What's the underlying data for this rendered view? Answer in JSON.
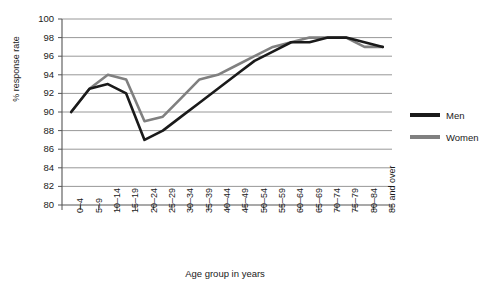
{
  "chart_data": {
    "type": "line",
    "title": "",
    "xlabel": "Age group in years",
    "ylabel": "% response rate",
    "ylim": [
      80,
      100
    ],
    "ytick_step": 2,
    "yticks": [
      "100",
      "98",
      "96",
      "94",
      "92",
      "90",
      "88",
      "86",
      "84",
      "82",
      "80"
    ],
    "grid": true,
    "legend_position": "right",
    "categories": [
      "0–4",
      "5–9",
      "10–14",
      "15–19",
      "20–24",
      "25–29",
      "30–34",
      "35–39",
      "40–44",
      "45–49",
      "50–54",
      "55–59",
      "60–64",
      "65–69",
      "70–74",
      "75–79",
      "80–84",
      "85 and over"
    ],
    "series": [
      {
        "name": "Men",
        "color": "#1a1a1a",
        "values": [
          90.0,
          92.5,
          93.0,
          92.0,
          87.0,
          88.0,
          89.5,
          91.0,
          92.5,
          94.0,
          95.5,
          96.5,
          97.5,
          97.5,
          98.0,
          98.0,
          97.5,
          97.0
        ]
      },
      {
        "name": "Women",
        "color": "#808080",
        "values": [
          90.0,
          92.5,
          94.0,
          93.5,
          89.0,
          89.5,
          91.5,
          93.5,
          94.0,
          95.0,
          96.0,
          97.0,
          97.5,
          98.0,
          98.0,
          98.0,
          97.0,
          97.0
        ]
      }
    ]
  },
  "legend": {
    "items": [
      {
        "label": "Men"
      },
      {
        "label": "Women"
      }
    ]
  },
  "axes": {
    "y_title": "% response rate",
    "x_title": "Age group in years"
  }
}
